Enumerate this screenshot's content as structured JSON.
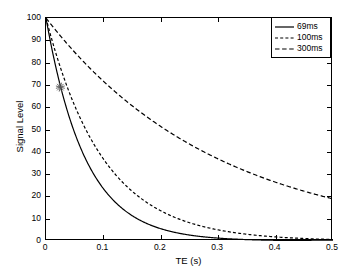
{
  "chart_data": {
    "type": "line",
    "title": "",
    "xlabel": "TE (s)",
    "ylabel": "Signal Level",
    "xlim": [
      0,
      0.5
    ],
    "ylim": [
      0,
      100
    ],
    "xticks": [
      "0",
      "0.1",
      "0.2",
      "0.3",
      "0.4",
      "0.5"
    ],
    "xtick_values": [
      0,
      0.1,
      0.2,
      0.3,
      0.4,
      0.5
    ],
    "yticks": [
      "0",
      "10",
      "20",
      "30",
      "40",
      "50",
      "60",
      "70",
      "80",
      "90",
      "100"
    ],
    "ytick_values": [
      0,
      10,
      20,
      30,
      40,
      50,
      60,
      70,
      80,
      90,
      100
    ],
    "grid": false,
    "legend_position": "upper-right",
    "model": "S(TE) = 100 * exp(-TE / T2)",
    "series": [
      {
        "name": "69ms",
        "T2_seconds": 0.069,
        "linestyle": "solid",
        "color": "#000000",
        "x": [
          0,
          0.025,
          0.05,
          0.075,
          0.1,
          0.125,
          0.15,
          0.175,
          0.2,
          0.225,
          0.25,
          0.275,
          0.3,
          0.325,
          0.35,
          0.375,
          0.4,
          0.425,
          0.45,
          0.475,
          0.5
        ],
        "values": [
          100,
          69.6,
          48.5,
          33.8,
          23.5,
          16.4,
          11.4,
          7.9,
          5.5,
          3.9,
          2.7,
          1.9,
          1.3,
          0.9,
          0.6,
          0.4,
          0.3,
          0.2,
          0.15,
          0.1,
          0.07
        ]
      },
      {
        "name": "100ms",
        "T2_seconds": 0.1,
        "linestyle": "dashed-fine",
        "color": "#000000",
        "x": [
          0,
          0.025,
          0.05,
          0.075,
          0.1,
          0.125,
          0.15,
          0.175,
          0.2,
          0.225,
          0.25,
          0.275,
          0.3,
          0.325,
          0.35,
          0.375,
          0.4,
          0.425,
          0.45,
          0.475,
          0.5
        ],
        "values": [
          100,
          77.9,
          60.7,
          47.2,
          36.8,
          28.7,
          22.3,
          17.4,
          13.5,
          10.5,
          8.2,
          6.4,
          5.0,
          3.9,
          3.0,
          2.4,
          1.8,
          1.4,
          1.1,
          0.9,
          0.7
        ]
      },
      {
        "name": "300ms",
        "T2_seconds": 0.3,
        "linestyle": "dashed-coarse",
        "color": "#000000",
        "x": [
          0,
          0.025,
          0.05,
          0.075,
          0.1,
          0.125,
          0.15,
          0.175,
          0.2,
          0.225,
          0.25,
          0.275,
          0.3,
          0.325,
          0.35,
          0.375,
          0.4,
          0.425,
          0.45,
          0.475,
          0.5
        ],
        "values": [
          100,
          92.0,
          84.6,
          77.9,
          71.7,
          65.9,
          60.7,
          55.8,
          51.3,
          47.2,
          43.5,
          40.0,
          36.8,
          33.9,
          31.2,
          28.7,
          26.4,
          24.3,
          22.3,
          20.5,
          18.9
        ]
      }
    ],
    "annotations": [
      {
        "name": "marker",
        "marker": "star",
        "x": 0.025,
        "y": 69,
        "label": ""
      }
    ],
    "legend": [
      {
        "label": "69ms",
        "linestyle": "solid"
      },
      {
        "label": "100ms",
        "linestyle": "dashed-fine"
      },
      {
        "label": "300ms",
        "linestyle": "dashed-coarse"
      }
    ]
  }
}
